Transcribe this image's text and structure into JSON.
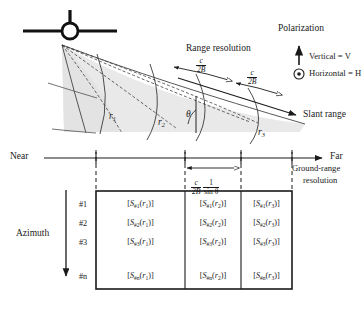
{
  "figure": {
    "type": "sar-radar-geometry-diagram",
    "background": "#ffffff",
    "ink": "#1a1a1a",
    "swath_fill": "#e8e8e8"
  },
  "annotations": {
    "polarization_title": "Polarization",
    "vertical": "Vertical = V",
    "horizontal": "Horizontal = H",
    "range_resolution": "Range resolution",
    "slant_range": "Slant range",
    "near": "Near",
    "far": "Far",
    "ground_range_resolution_line1": "Ground-range",
    "ground_range_resolution_line2": "resolution",
    "azimuth": "Azimuth",
    "theta": "θ",
    "range_res_formula": {
      "numerator": "c",
      "denominator": "2B"
    },
    "ground_res_formula": {
      "num1": "c",
      "den1": "2B",
      "num2": "1",
      "den2": "sin θ"
    },
    "range_arcs": [
      "r",
      "r",
      "r"
    ],
    "range_arc_subs": [
      "1",
      "2",
      "3"
    ]
  },
  "table": {
    "row_labels": [
      "#1",
      "#2",
      "#3",
      "#n"
    ],
    "columns": [
      "r1",
      "r2",
      "r3"
    ],
    "rows": [
      {
        "label": "#1",
        "cells": [
          {
            "s": "S",
            "sub": "#1",
            "arg": "r",
            "argsub": "1"
          },
          {
            "s": "S",
            "sub": "#1",
            "arg": "r",
            "argsub": "2"
          },
          {
            "s": "S",
            "sub": "#1",
            "arg": "r",
            "argsub": "3"
          }
        ]
      },
      {
        "label": "#2",
        "cells": [
          {
            "s": "S",
            "sub": "#2",
            "arg": "r",
            "argsub": "1"
          },
          {
            "s": "S",
            "sub": "#2",
            "arg": "r",
            "argsub": "2"
          },
          {
            "s": "S",
            "sub": "#2",
            "arg": "r",
            "argsub": "3"
          }
        ]
      },
      {
        "label": "#3",
        "cells": [
          {
            "s": "S",
            "sub": "#3",
            "arg": "r",
            "argsub": "1"
          },
          {
            "s": "S",
            "sub": "#3",
            "arg": "r",
            "argsub": "2"
          },
          {
            "s": "S",
            "sub": "#3",
            "arg": "r",
            "argsub": "3"
          }
        ]
      },
      {
        "label": "#n",
        "cells": [
          {
            "s": "S",
            "sub": "#n",
            "arg": "r",
            "argsub": "1"
          },
          {
            "s": "S",
            "sub": "#n",
            "arg": "r",
            "argsub": "2"
          },
          {
            "s": "S",
            "sub": "#n",
            "arg": "r",
            "argsub": "3"
          }
        ]
      }
    ]
  }
}
